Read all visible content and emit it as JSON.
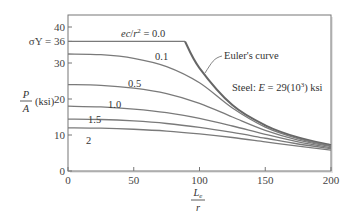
{
  "chart_data": {
    "type": "line",
    "title": "",
    "xlabel_num": "L",
    "xlabel_sub": "e",
    "xlabel_den": "r",
    "ylabel_num": "P",
    "ylabel_den": "A",
    "ylabel_unit": "(ksi)",
    "xlim": [
      0,
      200
    ],
    "ylim": [
      0,
      40
    ],
    "xticks": [
      "0",
      "50",
      "100",
      "150",
      "200"
    ],
    "yticks": [
      "0",
      "10",
      "20",
      "30",
      "40"
    ],
    "sigma_y_label": "σY = 36",
    "grid": false,
    "annotations": {
      "ec_label": "ec/r² = 0.0",
      "euler_label": "Euler's curve",
      "steel_label": "Steel: E = 29(10³) ksi"
    },
    "series": [
      {
        "name": "ec/r² = 0.0",
        "label": "",
        "x": [
          0,
          89,
          100,
          125,
          150,
          175,
          200
        ],
        "y": [
          36,
          36,
          28.6,
          18.3,
          12.7,
          9.3,
          7.2
        ]
      },
      {
        "name": "Euler's curve",
        "x": [
          89,
          100,
          125,
          150,
          175,
          200
        ],
        "y": [
          36,
          28.6,
          18.3,
          12.7,
          9.3,
          7.2
        ]
      },
      {
        "name": "0.1",
        "label": "0.1",
        "x": [
          0,
          25,
          50,
          75,
          100,
          125,
          150,
          175,
          200
        ],
        "y": [
          32.5,
          32.3,
          31.3,
          29,
          24.5,
          17.5,
          12.2,
          9.0,
          7.0
        ]
      },
      {
        "name": "0.5",
        "label": "0.5",
        "x": [
          0,
          25,
          50,
          75,
          100,
          125,
          150,
          175,
          200
        ],
        "y": [
          24,
          23.8,
          23,
          21.5,
          18.8,
          15,
          11.3,
          8.6,
          6.8
        ]
      },
      {
        "name": "1.0",
        "label": "1.0",
        "x": [
          0,
          25,
          50,
          75,
          100,
          125,
          150,
          175,
          200
        ],
        "y": [
          18,
          17.8,
          17.2,
          16.2,
          14.6,
          12.5,
          10.2,
          8.1,
          6.5
        ]
      },
      {
        "name": "1.5",
        "label": "1.5",
        "x": [
          0,
          25,
          50,
          75,
          100,
          125,
          150,
          175,
          200
        ],
        "y": [
          14.4,
          14.3,
          13.9,
          13.2,
          12.1,
          10.7,
          9.1,
          7.5,
          6.2
        ]
      },
      {
        "name": "2",
        "label": "2",
        "x": [
          0,
          25,
          50,
          75,
          100,
          125,
          150,
          175,
          200
        ],
        "y": [
          12,
          11.9,
          11.6,
          11.1,
          10.3,
          9.3,
          8.1,
          6.9,
          5.8
        ]
      }
    ]
  }
}
